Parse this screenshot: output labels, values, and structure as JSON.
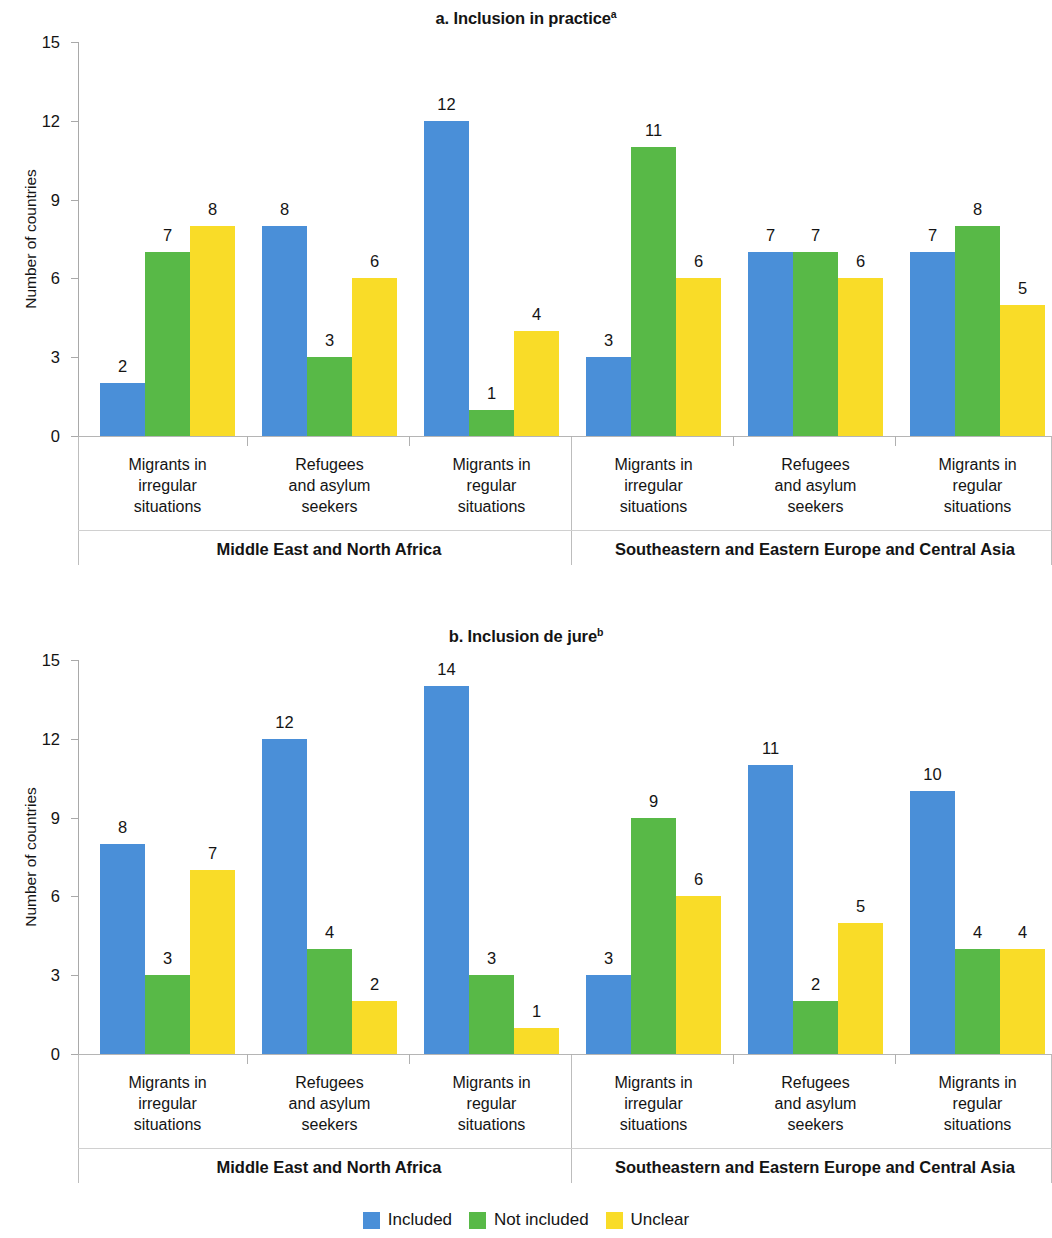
{
  "colors": {
    "included": "#4a8fd8",
    "not_included": "#58b947",
    "unclear": "#f9dc28",
    "axis": "#a9a9a9",
    "text": "#141414"
  },
  "legend": {
    "items": [
      {
        "label": "Included",
        "color_key": "included"
      },
      {
        "label": "Not included",
        "color_key": "not_included"
      },
      {
        "label": "Unclear",
        "color_key": "unclear"
      }
    ]
  },
  "panel_a": {
    "title": "a. Inclusion in practice",
    "title_superscript": "a",
    "ylabel": "Number of countries",
    "yticks": [
      "0",
      "3",
      "6",
      "9",
      "12",
      "15"
    ],
    "categories": [
      "Migrants in\nirregular\nsituations",
      "Refugees\nand asylum\nseekers",
      "Migrants in\nregular\nsituations",
      "Migrants in\nirregular\nsituations",
      "Refugees\nand asylum\nseekers",
      "Migrants in\nregular\nsituations"
    ],
    "regions": [
      "Middle East and North Africa",
      "Southeastern and Eastern Europe and Central Asia"
    ]
  },
  "panel_b": {
    "title": "b. Inclusion de jure",
    "title_superscript": "b",
    "ylabel": "Number of countries",
    "yticks": [
      "0",
      "3",
      "6",
      "9",
      "12",
      "15"
    ],
    "categories": [
      "Migrants in\nirregular\nsituations",
      "Refugees\nand asylum\nseekers",
      "Migrants in\nregular\nsituations",
      "Migrants in\nirregular\nsituations",
      "Refugees\nand asylum\nseekers",
      "Migrants in\nregular\nsituations"
    ],
    "regions": [
      "Middle East and North Africa",
      "Southeastern and Eastern Europe and Central Asia"
    ]
  },
  "chart_data": [
    {
      "type": "bar",
      "title": "a. Inclusion in practice",
      "xlabel": "",
      "ylabel": "Number of countries",
      "ylim": [
        0,
        15
      ],
      "yticks": [
        0,
        3,
        6,
        9,
        12,
        15
      ],
      "grid": false,
      "legend_position": "bottom",
      "categories": [
        "Migrants in irregular situations",
        "Refugees and asylum seekers",
        "Migrants in regular situations",
        "Migrants in irregular situations",
        "Refugees and asylum seekers",
        "Migrants in regular situations"
      ],
      "groups": [
        {
          "region": "Middle East and North Africa",
          "categories": [
            0,
            1,
            2
          ]
        },
        {
          "region": "Southeastern and Eastern Europe and Central Asia",
          "categories": [
            3,
            4,
            5
          ]
        }
      ],
      "series": [
        {
          "name": "Included",
          "color": "#4a8fd8",
          "values": [
            2,
            8,
            12,
            3,
            7,
            7
          ]
        },
        {
          "name": "Not included",
          "color": "#58b947",
          "values": [
            7,
            3,
            1,
            11,
            7,
            8
          ]
        },
        {
          "name": "Unclear",
          "color": "#f9dc28",
          "values": [
            8,
            6,
            4,
            6,
            6,
            5
          ]
        }
      ]
    },
    {
      "type": "bar",
      "title": "b. Inclusion de jure",
      "xlabel": "",
      "ylabel": "Number of countries",
      "ylim": [
        0,
        15
      ],
      "yticks": [
        0,
        3,
        6,
        9,
        12,
        15
      ],
      "grid": false,
      "legend_position": "bottom",
      "categories": [
        "Migrants in irregular situations",
        "Refugees and asylum seekers",
        "Migrants in regular situations",
        "Migrants in irregular situations",
        "Refugees and asylum seekers",
        "Migrants in regular situations"
      ],
      "groups": [
        {
          "region": "Middle East and North Africa",
          "categories": [
            0,
            1,
            2
          ]
        },
        {
          "region": "Southeastern and Eastern Europe and Central Asia",
          "categories": [
            3,
            4,
            5
          ]
        }
      ],
      "series": [
        {
          "name": "Included",
          "color": "#4a8fd8",
          "values": [
            8,
            12,
            14,
            3,
            11,
            10
          ]
        },
        {
          "name": "Not included",
          "color": "#58b947",
          "values": [
            3,
            4,
            3,
            9,
            2,
            4
          ]
        },
        {
          "name": "Unclear",
          "color": "#f9dc28",
          "values": [
            7,
            2,
            1,
            6,
            5,
            4
          ]
        }
      ]
    }
  ]
}
